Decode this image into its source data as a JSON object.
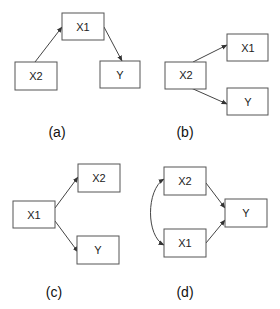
{
  "diagrams": [
    {
      "id": "a",
      "caption": "(a)",
      "nodes": {
        "X1": "X1",
        "X2": "X2",
        "Y": "Y"
      },
      "edges": [
        {
          "from": "X2",
          "to": "X1"
        },
        {
          "from": "X1",
          "to": "Y"
        }
      ]
    },
    {
      "id": "b",
      "caption": "(b)",
      "nodes": {
        "X2": "X2",
        "X1": "X1",
        "Y": "Y"
      },
      "edges": [
        {
          "from": "X2",
          "to": "X1"
        },
        {
          "from": "X2",
          "to": "Y"
        }
      ]
    },
    {
      "id": "c",
      "caption": "(c)",
      "nodes": {
        "X1": "X1",
        "X2": "X2",
        "Y": "Y"
      },
      "edges": [
        {
          "from": "X1",
          "to": "X2"
        },
        {
          "from": "X1",
          "to": "Y"
        }
      ]
    },
    {
      "id": "d",
      "caption": "(d)",
      "nodes": {
        "X2": "X2",
        "X1": "X1",
        "Y": "Y"
      },
      "edges": [
        {
          "from": "X2",
          "to": "Y"
        },
        {
          "from": "X1",
          "to": "Y"
        },
        {
          "from": "X1",
          "to": "X2",
          "type": "bidirectional-curved"
        }
      ]
    }
  ],
  "colors": {
    "stroke": "#555555",
    "arrow": "#444444",
    "text": "#222222",
    "background": "#ffffff"
  }
}
